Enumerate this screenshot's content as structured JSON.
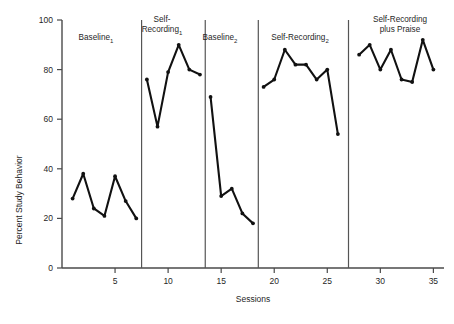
{
  "chart_data": {
    "type": "line",
    "title": "",
    "xlabel": "Sessions",
    "ylabel": "Percent Study Behavior",
    "xlim": [
      0,
      36
    ],
    "ylim": [
      0,
      100
    ],
    "grid": false,
    "legend": "none",
    "y_ticks": [
      0,
      20,
      40,
      60,
      80,
      100
    ],
    "y_tick_labels": [
      "0",
      "20",
      "40",
      "60",
      "80",
      "100"
    ],
    "x_ticks": [
      5,
      10,
      15,
      20,
      25,
      30,
      35
    ],
    "x_tick_labels": [
      "5",
      "10",
      "15",
      "20",
      "25",
      "30",
      "35"
    ],
    "phases": [
      {
        "name": "Baseline",
        "subscript": "1",
        "label_line1": "Baseline",
        "label_line2": "",
        "x_start": 1,
        "x_end": 7,
        "x": [
          1,
          2,
          3,
          4,
          5,
          6,
          7
        ],
        "values": [
          28,
          38,
          24,
          21,
          37,
          27,
          20
        ]
      },
      {
        "name": "Self-Recording",
        "subscript": "1",
        "label_line1": "Self-",
        "label_line2": "Recording",
        "x_start": 8,
        "x_end": 13,
        "x": [
          8,
          9,
          10,
          11,
          12,
          13
        ],
        "values": [
          76,
          57,
          79,
          90,
          80,
          78
        ]
      },
      {
        "name": "Baseline",
        "subscript": "2",
        "label_line1": "Baseline",
        "label_line2": "",
        "x_start": 14,
        "x_end": 18,
        "x": [
          14,
          15,
          16,
          17,
          18
        ],
        "values": [
          69,
          29,
          32,
          22,
          18
        ]
      },
      {
        "name": "Self-Recording",
        "subscript": "2",
        "label_line1": "Self-Recording",
        "label_line2": "",
        "x_start": 19,
        "x_end": 26,
        "x": [
          19,
          20,
          21,
          22,
          23,
          24,
          25,
          26
        ],
        "values": [
          73,
          76,
          88,
          82,
          82,
          76,
          80,
          54
        ]
      },
      {
        "name": "Self-Recording plus Praise",
        "subscript": "",
        "label_line1": "Self-Recording",
        "label_line2": "plus Praise",
        "x_start": 28,
        "x_end": 35,
        "x": [
          28,
          29,
          30,
          31,
          32,
          33,
          34,
          35
        ],
        "values": [
          86,
          90,
          80,
          88,
          76,
          75,
          92,
          80
        ]
      }
    ],
    "phase_divider_x": [
      7.5,
      13.5,
      18.5,
      27.0
    ],
    "colors": {
      "line": "#111111",
      "axis": "#4a4a4a",
      "divider": "#555555",
      "background": "#ffffff"
    }
  }
}
